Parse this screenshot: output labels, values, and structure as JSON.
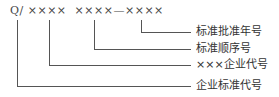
{
  "diagram": {
    "code": "Q/ ××××  ××××—××××",
    "labels": [
      {
        "id": "year",
        "text": "标准批准年号"
      },
      {
        "id": "sequence",
        "text": "标准顺序号"
      },
      {
        "id": "enterprise",
        "text": "×××企业代号"
      },
      {
        "id": "standard",
        "text": "企业标准代号"
      }
    ]
  }
}
